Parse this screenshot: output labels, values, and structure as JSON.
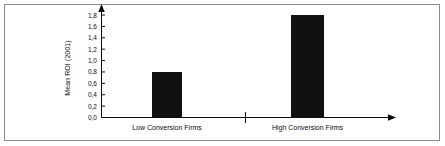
{
  "chart_data": {
    "type": "bar",
    "title": "",
    "xlabel": "",
    "ylabel": "Mean ROI (2001)",
    "categories": [
      "Low Conversion Firms",
      "High Conversion Firms"
    ],
    "values": [
      0.8,
      1.8
    ],
    "ylim": [
      0.0,
      1.8
    ],
    "ytick_labels": [
      "1,8",
      "1,6",
      "1,4",
      "1,2",
      "1,0",
      "0,8",
      "0,6",
      "0,4",
      "0,2",
      "0,0"
    ],
    "ytick_values": [
      1.8,
      1.6,
      1.4,
      1.2,
      1.0,
      0.8,
      0.6,
      0.4,
      0.2,
      0.0
    ],
    "grid": false,
    "legend": "none",
    "bar_color": "#111111",
    "axis_color": "#0b0b0b",
    "decimal_separator": ","
  },
  "figure": {
    "border_color": "#8c8c8c",
    "background": "#ffffff"
  },
  "axes": {
    "y_arrow": "arrow-up",
    "x_arrow": "arrow-right"
  }
}
